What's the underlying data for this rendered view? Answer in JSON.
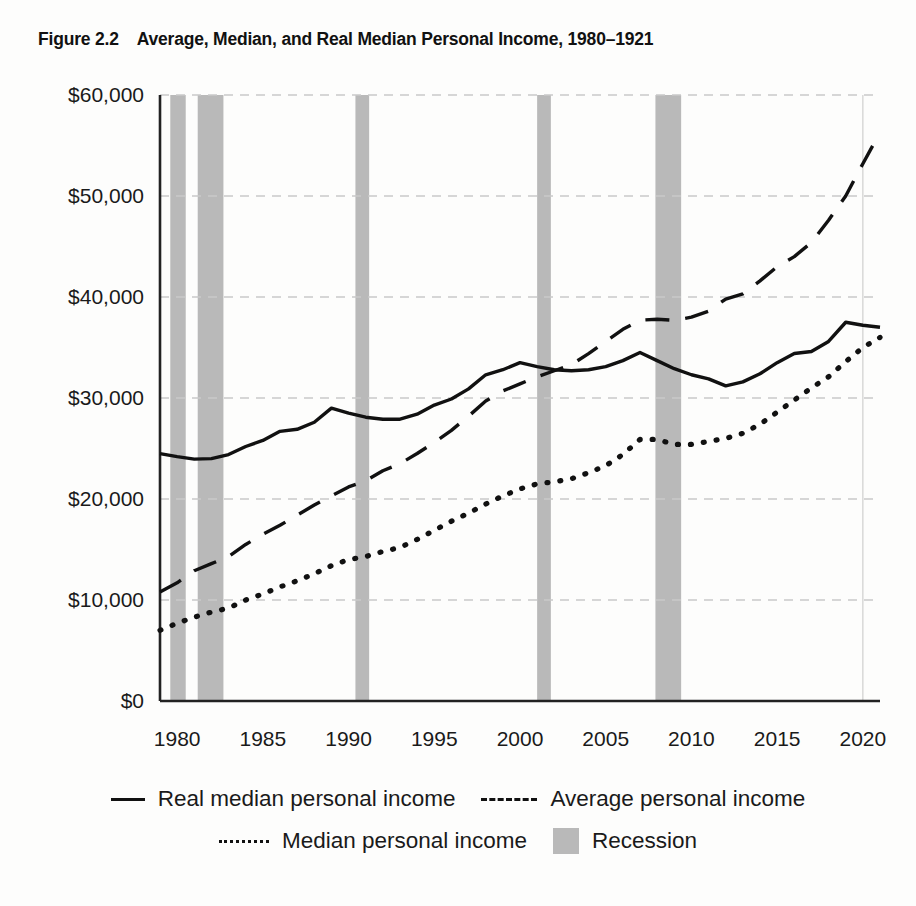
{
  "figure": {
    "number": "Figure 2.2",
    "title": "Average, Median, and Real Median Personal Income, 1980–1921"
  },
  "axes": {
    "y_ticks": [
      "$0",
      "$10,000",
      "$20,000",
      "$30,000",
      "$40,000",
      "$50,000",
      "$60,000"
    ],
    "x_ticks": [
      "1980",
      "1985",
      "1990",
      "1995",
      "2000",
      "2005",
      "2010",
      "2015",
      "2020"
    ]
  },
  "legend": {
    "row1": [
      {
        "label": "Real median personal income",
        "style": "solid",
        "icon": "solid-line-swatch"
      },
      {
        "label": "Average personal income",
        "style": "dashed",
        "icon": "dashed-line-swatch"
      }
    ],
    "row2": [
      {
        "label": "Median personal income",
        "style": "dotted",
        "icon": "dotted-line-swatch"
      },
      {
        "label": "Recession",
        "style": "band",
        "icon": "gray-band-swatch"
      }
    ]
  },
  "colors": {
    "line": "#111111",
    "recession_band": "#b9b9b9",
    "gridline": "#c9c9c9",
    "axis": "#222222",
    "background": "#fdfdfc"
  },
  "chart_data": {
    "type": "line",
    "title": "Average, Median, and Real Median Personal Income, 1980–1921",
    "xlabel": "",
    "ylabel": "",
    "xlim": [
      1979,
      2021
    ],
    "ylim": [
      0,
      60000
    ],
    "ytick_values": [
      0,
      10000,
      20000,
      30000,
      40000,
      50000,
      60000
    ],
    "xtick_values": [
      1980,
      1985,
      1990,
      1995,
      2000,
      2005,
      2010,
      2015,
      2020
    ],
    "grid": "horizontal-dashed",
    "legend_position": "below",
    "x": [
      1979,
      1980,
      1981,
      1982,
      1983,
      1984,
      1985,
      1986,
      1987,
      1988,
      1989,
      1990,
      1991,
      1992,
      1993,
      1994,
      1995,
      1996,
      1997,
      1998,
      1999,
      2000,
      2001,
      2002,
      2003,
      2004,
      2005,
      2006,
      2007,
      2008,
      2009,
      2010,
      2011,
      2012,
      2013,
      2014,
      2015,
      2016,
      2017,
      2018,
      2019,
      2020,
      2021
    ],
    "series": [
      {
        "name": "Real median personal income",
        "style": "solid",
        "values": [
          24500,
          24200,
          23950,
          24000,
          24400,
          25200,
          25800,
          26700,
          26900,
          27600,
          29000,
          28500,
          28100,
          27900,
          27900,
          28400,
          29300,
          29900,
          30900,
          32300,
          32800,
          33500,
          33100,
          32800,
          32700,
          32800,
          33100,
          33700,
          34500,
          33700,
          32900,
          32300,
          31900,
          31200,
          31600,
          32400,
          33500,
          34400,
          34600,
          35600,
          37500,
          37200,
          37000
        ]
      },
      {
        "name": "Average personal income",
        "style": "dashed",
        "values": [
          10800,
          11700,
          12900,
          13600,
          14300,
          15500,
          16500,
          17400,
          18400,
          19400,
          20300,
          21200,
          21800,
          22800,
          23500,
          24500,
          25600,
          26800,
          28200,
          29700,
          30700,
          31400,
          32100,
          32700,
          33300,
          34400,
          35600,
          36800,
          37700,
          37800,
          37700,
          38000,
          38600,
          39800,
          40300,
          41600,
          43000,
          44000,
          45400,
          47600,
          50000,
          53200,
          56300
        ]
      },
      {
        "name": "Median personal income",
        "style": "dotted",
        "values": [
          7000,
          7700,
          8300,
          8800,
          9200,
          10000,
          10600,
          11300,
          11900,
          12600,
          13400,
          14000,
          14300,
          14800,
          15200,
          16000,
          16900,
          17800,
          18600,
          19500,
          20300,
          21000,
          21500,
          21700,
          22000,
          22600,
          23300,
          24400,
          25900,
          25900,
          25400,
          25400,
          25700,
          26000,
          26500,
          27400,
          28600,
          29800,
          31000,
          32100,
          33600,
          35000,
          36000
        ]
      }
    ],
    "recessions": [
      {
        "start": 1979.6,
        "end": 1980.5
      },
      {
        "start": 1981.2,
        "end": 1982.7
      },
      {
        "start": 1990.4,
        "end": 1991.2
      },
      {
        "start": 2001.0,
        "end": 2001.8
      },
      {
        "start": 2007.9,
        "end": 2009.4
      }
    ]
  }
}
